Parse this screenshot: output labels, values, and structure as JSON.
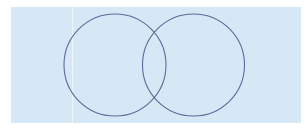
{
  "diagram": {
    "type": "venn",
    "background_color": "#d6e8f6",
    "stroke_color": "#5a6a9a",
    "sets": [
      {
        "id": "left-set",
        "cx": 115,
        "cy": 65,
        "r": 51
      },
      {
        "id": "right-set",
        "cx": 193.5,
        "cy": 65,
        "r": 51
      }
    ]
  }
}
